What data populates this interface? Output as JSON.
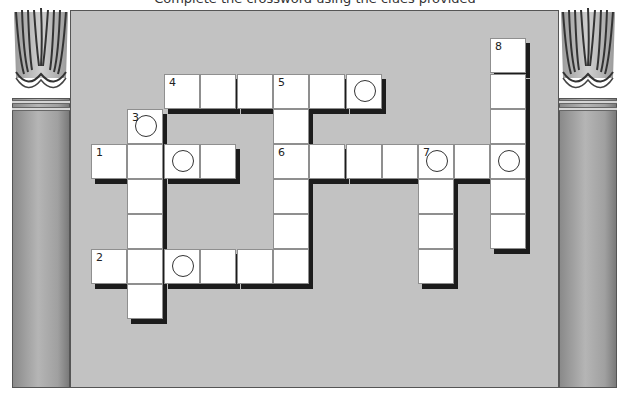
{
  "title": "Complete the crossword using the clues provided",
  "colors": {
    "panel": "#c2c2c2",
    "cell": "#ffffff",
    "shadow": "#1c1c1c",
    "pillar": "#a0a0a0"
  },
  "clue_numbers": [
    "1",
    "2",
    "3",
    "4",
    "5",
    "6",
    "7",
    "8"
  ],
  "grid": {
    "cell_size": 36,
    "cells": [
      {
        "x": 164,
        "y": 74,
        "num": "4",
        "circle": false
      },
      {
        "x": 200,
        "y": 74,
        "num": "",
        "circle": false
      },
      {
        "x": 237,
        "y": 74,
        "num": "",
        "circle": false
      },
      {
        "x": 273,
        "y": 74,
        "num": "5",
        "circle": false
      },
      {
        "x": 309,
        "y": 74,
        "num": "",
        "circle": false
      },
      {
        "x": 346,
        "y": 74,
        "num": "",
        "circle": true
      },
      {
        "x": 127,
        "y": 109,
        "num": "3",
        "circle": true
      },
      {
        "x": 273,
        "y": 109,
        "num": "",
        "circle": false
      },
      {
        "x": 91,
        "y": 144,
        "num": "1",
        "circle": false
      },
      {
        "x": 127,
        "y": 144,
        "num": "",
        "circle": false
      },
      {
        "x": 164,
        "y": 144,
        "num": "",
        "circle": true
      },
      {
        "x": 200,
        "y": 144,
        "num": "",
        "circle": false
      },
      {
        "x": 273,
        "y": 144,
        "num": "6",
        "circle": false
      },
      {
        "x": 309,
        "y": 144,
        "num": "",
        "circle": false
      },
      {
        "x": 346,
        "y": 144,
        "num": "",
        "circle": false
      },
      {
        "x": 382,
        "y": 144,
        "num": "",
        "circle": false
      },
      {
        "x": 418,
        "y": 144,
        "num": "7",
        "circle": true
      },
      {
        "x": 454,
        "y": 144,
        "num": "",
        "circle": false
      },
      {
        "x": 490,
        "y": 144,
        "num": "",
        "circle": true
      },
      {
        "x": 490,
        "y": 38,
        "num": "8",
        "circle": false
      },
      {
        "x": 490,
        "y": 74,
        "num": "",
        "circle": false
      },
      {
        "x": 490,
        "y": 109,
        "num": "",
        "circle": false
      },
      {
        "x": 490,
        "y": 179,
        "num": "",
        "circle": false
      },
      {
        "x": 490,
        "y": 214,
        "num": "",
        "circle": false
      },
      {
        "x": 127,
        "y": 179,
        "num": "",
        "circle": false
      },
      {
        "x": 127,
        "y": 214,
        "num": "",
        "circle": false
      },
      {
        "x": 273,
        "y": 179,
        "num": "",
        "circle": false
      },
      {
        "x": 273,
        "y": 214,
        "num": "",
        "circle": false
      },
      {
        "x": 418,
        "y": 179,
        "num": "",
        "circle": false
      },
      {
        "x": 418,
        "y": 214,
        "num": "",
        "circle": false
      },
      {
        "x": 418,
        "y": 249,
        "num": "",
        "circle": false
      },
      {
        "x": 91,
        "y": 249,
        "num": "2",
        "circle": false
      },
      {
        "x": 127,
        "y": 249,
        "num": "",
        "circle": false
      },
      {
        "x": 164,
        "y": 249,
        "num": "",
        "circle": true
      },
      {
        "x": 200,
        "y": 249,
        "num": "",
        "circle": false
      },
      {
        "x": 237,
        "y": 249,
        "num": "",
        "circle": false
      },
      {
        "x": 273,
        "y": 249,
        "num": "",
        "circle": false
      },
      {
        "x": 127,
        "y": 284,
        "num": "",
        "circle": false
      }
    ]
  }
}
